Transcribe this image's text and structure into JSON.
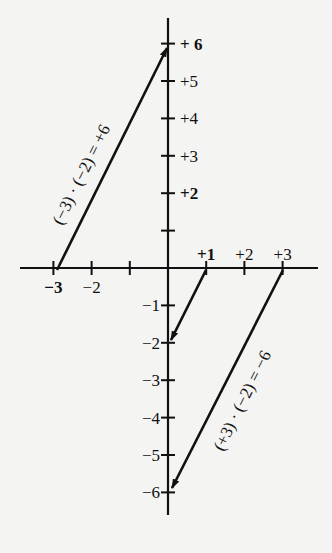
{
  "diagram": {
    "colors": {
      "background": "#f4f4f2",
      "ink": "#111111"
    },
    "x_axis": {
      "ticks": [
        -3,
        -2,
        -1,
        0,
        1,
        2,
        3
      ],
      "labels": [
        {
          "value": -3,
          "text": "−3",
          "bold": true
        },
        {
          "value": -2,
          "text": "−2",
          "bold": false
        },
        {
          "value": 1,
          "text": "+1",
          "bold": true
        },
        {
          "value": 2,
          "text": "+2",
          "bold": false
        },
        {
          "value": 3,
          "text": "+3",
          "bold": false
        }
      ]
    },
    "y_axis": {
      "ticks": [
        6,
        5,
        4,
        3,
        2,
        1,
        -1,
        -2,
        -3,
        -4,
        -5,
        -6
      ],
      "labels": [
        {
          "value": 6,
          "text": "+ 6",
          "bold": true
        },
        {
          "value": 5,
          "text": "+5",
          "bold": false
        },
        {
          "value": 4,
          "text": "+4",
          "bold": false
        },
        {
          "value": 3,
          "text": "+3",
          "bold": false
        },
        {
          "value": 2,
          "text": "+2",
          "bold": true
        },
        {
          "value": -1,
          "text": "−1",
          "bold": false
        },
        {
          "value": -2,
          "text": "−2",
          "bold": false
        },
        {
          "value": -3,
          "text": "−3",
          "bold": false
        },
        {
          "value": -4,
          "text": "−4",
          "bold": false
        },
        {
          "value": -5,
          "text": "−5",
          "bold": false
        },
        {
          "value": -6,
          "text": "−6",
          "bold": false
        }
      ]
    },
    "arrows": [
      {
        "from": [
          -3,
          0
        ],
        "to": [
          0,
          6
        ],
        "label": "(−3) · (−2) = +6"
      },
      {
        "from": [
          1,
          0
        ],
        "to": [
          0,
          -2
        ],
        "label": ""
      },
      {
        "from": [
          3,
          0
        ],
        "to": [
          0,
          -6
        ],
        "label": "(+3) · (−2) = −6"
      }
    ]
  }
}
